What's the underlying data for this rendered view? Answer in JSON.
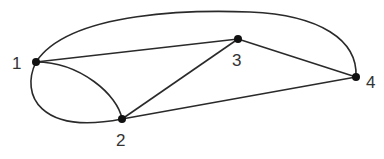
{
  "diagram": {
    "type": "multigraph",
    "nodes": [
      {
        "id": "1",
        "label": "1",
        "x": 36,
        "y": 62,
        "lx": 12,
        "ly": 69
      },
      {
        "id": "2",
        "label": "2",
        "x": 122,
        "y": 119,
        "lx": 116,
        "ly": 146
      },
      {
        "id": "3",
        "label": "3",
        "x": 238,
        "y": 39,
        "lx": 232,
        "ly": 66
      },
      {
        "id": "4",
        "label": "4",
        "x": 356,
        "y": 77,
        "lx": 366,
        "ly": 88
      }
    ],
    "edges": [
      {
        "from": "1",
        "to": "2",
        "shape": "curve-upper"
      },
      {
        "from": "1",
        "to": "2",
        "shape": "curve-lower"
      },
      {
        "from": "1",
        "to": "3",
        "shape": "straight"
      },
      {
        "from": "1",
        "to": "4",
        "shape": "arc-top"
      },
      {
        "from": "2",
        "to": "3",
        "shape": "straight"
      },
      {
        "from": "2",
        "to": "4",
        "shape": "straight"
      },
      {
        "from": "3",
        "to": "4",
        "shape": "straight"
      }
    ]
  }
}
